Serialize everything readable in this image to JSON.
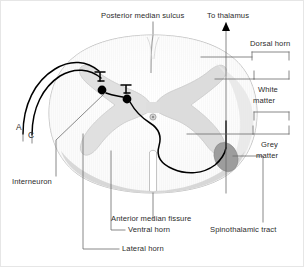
{
  "figure": {
    "background_color": "#ffffff",
    "border_color": "#e6e6e6"
  },
  "colors": {
    "white_matter": "#fafafa",
    "white_matter_stroke": "#b9b9b9",
    "grey_matter": "#e3e3e3",
    "grey_matter_stroke": "#cfcfcf",
    "grey_matter_shaded": "#dadada",
    "spinothalamic_tract": "#9d9d9d",
    "neuron_path": "#000000",
    "leader_line": "#6b6b6b",
    "text": "#2b2b2b",
    "central_canal": "#9a9a9a"
  },
  "labels": {
    "posterior_median_sulcus": "Posterior median sulcus",
    "to_thalamus": "To thalamus",
    "dorsal_horn": "Dorsal horn",
    "white_matter_line1": "White",
    "white_matter_line2": "matter",
    "grey_matter_line1": "Grey",
    "grey_matter_line2": "matter",
    "fiber_a": "A",
    "fiber_c": "C",
    "interneuron": "Interneuron",
    "anterior_median_fissure": "Anterior median fissure",
    "ventral_horn": "Ventral horn",
    "lateral_horn": "Lateral horn",
    "spinothalamic_tract": "Spinothalamic tract"
  },
  "anatomy": {
    "structures": [
      "white matter",
      "grey matter",
      "dorsal horn",
      "lateral horn",
      "ventral horn",
      "central canal",
      "posterior median sulcus",
      "anterior median fissure",
      "spinothalamic tract"
    ],
    "pathway": [
      "A fiber afferent",
      "C fiber afferent",
      "first-order neuron cell body",
      "interneuron",
      "second-order neuron",
      "decussation to contralateral spinothalamic tract",
      "ascending to thalamus"
    ],
    "neuron_dots": 2
  }
}
